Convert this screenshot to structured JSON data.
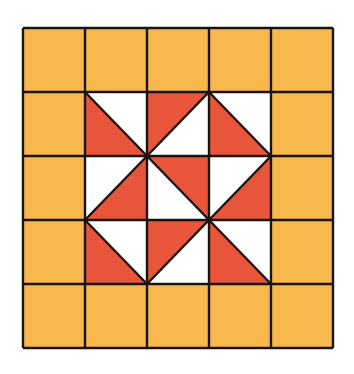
{
  "figure": {
    "rows": 5,
    "cols": 5,
    "colors": {
      "border_fill": "#F8B84E",
      "red": "#E8553A",
      "white": "#FFFFFF",
      "line": "#1A1410"
    },
    "x_lines": [
      23,
      85,
      147,
      209,
      271,
      333
    ],
    "y_lines": [
      28,
      92,
      156,
      220,
      284,
      348
    ],
    "inner_cells": [
      {
        "row": 1,
        "col": 1,
        "diag": "tl-br",
        "red": "bl"
      },
      {
        "row": 1,
        "col": 2,
        "diag": "bl-tr",
        "red": "tl"
      },
      {
        "row": 1,
        "col": 3,
        "diag": "tl-br",
        "red": "bl"
      },
      {
        "row": 2,
        "col": 1,
        "diag": "bl-tr",
        "red": "br"
      },
      {
        "row": 2,
        "col": 2,
        "diag": "tl-br",
        "red": "tr"
      },
      {
        "row": 2,
        "col": 3,
        "diag": "bl-tr",
        "red": "br"
      },
      {
        "row": 3,
        "col": 1,
        "diag": "tl-br",
        "red": "bl"
      },
      {
        "row": 3,
        "col": 2,
        "diag": "bl-tr",
        "red": "tl"
      },
      {
        "row": 3,
        "col": 3,
        "diag": "tl-br",
        "red": "bl"
      }
    ]
  }
}
